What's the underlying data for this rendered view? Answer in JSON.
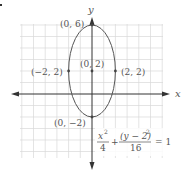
{
  "figure": {
    "marker": "a.",
    "axes": {
      "x_label": "x",
      "y_label": "y"
    },
    "points": [
      {
        "label": "(0, 6)",
        "x": 0,
        "y": 6
      },
      {
        "label": "(0, 2)",
        "x": 0,
        "y": 2
      },
      {
        "label": "(−2, 2)",
        "x": -2,
        "y": 2
      },
      {
        "label": "(2, 2)",
        "x": 2,
        "y": 2
      },
      {
        "label": "(0, −2)",
        "x": 0,
        "y": -2
      }
    ],
    "equation": {
      "term1_num": "x",
      "term1_exp": "2",
      "term1_den": "4",
      "plus": "+",
      "term2_num": "(y − 2)",
      "term2_exp": "2",
      "term2_den": "16",
      "equals": "= 1"
    },
    "ellipse": {
      "center": [
        0,
        2
      ],
      "a_horizontal": 2,
      "b_vertical": 4
    },
    "colors": {
      "grid": "#d8d8d8",
      "axis": "#333333",
      "curve": "#555555",
      "text": "#555555"
    }
  }
}
